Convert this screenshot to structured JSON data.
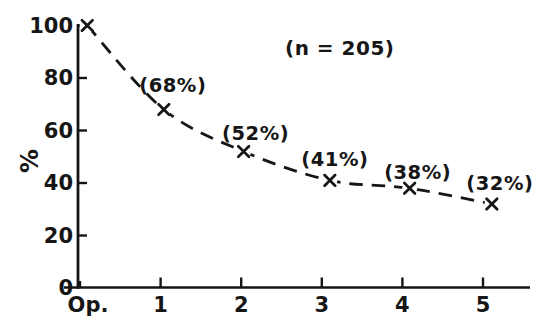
{
  "chart_data": {
    "type": "line",
    "title": "",
    "xlabel": "",
    "ylabel": "%",
    "annotation": "(n = 205)",
    "categories": [
      "Op.",
      "1",
      "2",
      "3",
      "4",
      "5"
    ],
    "x": [
      0,
      1,
      2,
      3,
      4,
      5
    ],
    "series": [
      {
        "name": "percent-remaining",
        "values": [
          100,
          68,
          52,
          41,
          38,
          32
        ]
      }
    ],
    "point_labels": [
      "",
      "(68%)",
      "(52%)",
      "(41%)",
      "(38%)",
      "(32%)"
    ],
    "yticks": [
      0,
      20,
      40,
      60,
      80,
      100
    ],
    "ylim": [
      0,
      105
    ],
    "xlim": [
      -0.2,
      5.6
    ],
    "grid": false,
    "legend": "none",
    "line_style": "dashed",
    "marker": "x",
    "ink_color": "#161616",
    "background_color": "#ffffff",
    "layout_hints": {
      "point_x_offsets": [
        0.09,
        0.04,
        0.03,
        0.1,
        0.09,
        0.11
      ],
      "label_offsets": [
        [
          0,
          0
        ],
        [
          9,
          -24
        ],
        [
          12,
          -18
        ],
        [
          5,
          -20
        ],
        [
          8,
          -15
        ],
        [
          8,
          -20
        ]
      ],
      "xtick_label_dx": [
        8,
        0,
        0,
        0,
        0,
        0
      ]
    }
  }
}
